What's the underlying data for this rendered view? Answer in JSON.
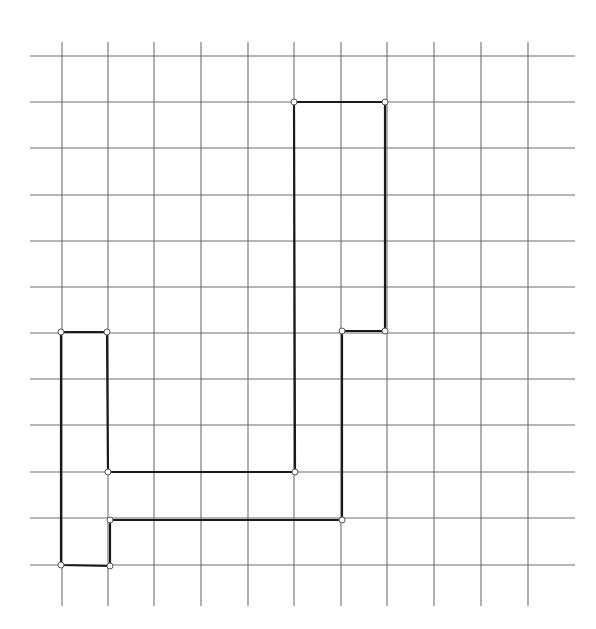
{
  "diagram": {
    "type": "grid-polygon",
    "colors": {
      "background": "#ffffff",
      "grid_line": "#6e6e6e",
      "polygon_stroke": "#1a1a1a",
      "vertex_marker": "#555555"
    },
    "grid": {
      "vertical_lines_x": [
        62,
        108,
        154,
        201,
        248,
        294,
        341,
        387,
        434,
        481,
        528
      ],
      "horizontal_lines_y": [
        56,
        102,
        148,
        195,
        241,
        287,
        333,
        379,
        425,
        472,
        518,
        565
      ],
      "horizontal_span": [
        30,
        575
      ],
      "vertical_span": [
        42,
        606
      ]
    },
    "polygon": {
      "vertices": [
        [
          294,
          102
        ],
        [
          385,
          102
        ],
        [
          385,
          331
        ],
        [
          342,
          331
        ],
        [
          342,
          520
        ],
        [
          110,
          520
        ],
        [
          110,
          566
        ],
        [
          61,
          565
        ],
        [
          61,
          332
        ],
        [
          107,
          332
        ],
        [
          108,
          472
        ],
        [
          295,
          472
        ]
      ],
      "grid_vertices": [
        [
          5,
          1
        ],
        [
          7,
          1
        ],
        [
          7,
          6
        ],
        [
          6,
          6
        ],
        [
          6,
          10
        ],
        [
          1,
          10
        ],
        [
          1,
          11
        ],
        [
          0,
          11
        ],
        [
          0,
          6
        ],
        [
          1,
          6
        ],
        [
          1,
          9
        ],
        [
          5,
          9
        ]
      ]
    }
  }
}
